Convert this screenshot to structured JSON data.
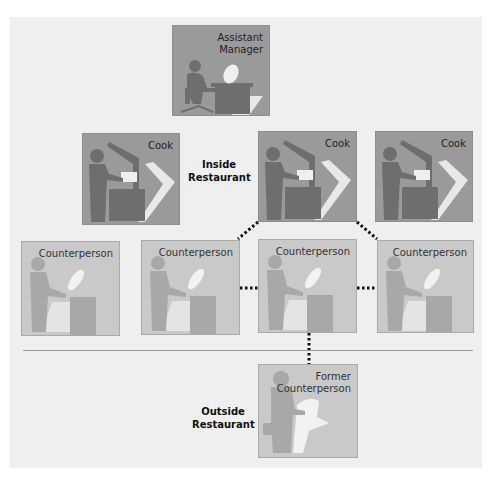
{
  "diagram": {
    "nodes": [
      {
        "id": "assistant-manager",
        "label_lines": [
          "Assistant",
          "Manager"
        ],
        "group": "inside",
        "shade": "dark",
        "icon": "person-at-desk-icon"
      },
      {
        "id": "cook-1",
        "label_lines": [
          "Cook"
        ],
        "group": "inside",
        "shade": "dark",
        "icon": "cook-at-grill-icon"
      },
      {
        "id": "cook-2",
        "label_lines": [
          "Cook"
        ],
        "group": "inside",
        "shade": "dark",
        "icon": "cook-at-grill-icon"
      },
      {
        "id": "cook-3",
        "label_lines": [
          "Cook"
        ],
        "group": "inside",
        "shade": "dark",
        "icon": "cook-at-grill-icon"
      },
      {
        "id": "counterperson-1",
        "label_lines": [
          "Counterperson"
        ],
        "group": "inside",
        "shade": "light",
        "icon": "counterperson-icon"
      },
      {
        "id": "counterperson-2",
        "label_lines": [
          "Counterperson"
        ],
        "group": "inside",
        "shade": "light",
        "icon": "counterperson-icon"
      },
      {
        "id": "counterperson-3",
        "label_lines": [
          "Counterperson"
        ],
        "group": "inside",
        "shade": "light",
        "icon": "counterperson-icon"
      },
      {
        "id": "counterperson-4",
        "label_lines": [
          "Counterperson"
        ],
        "group": "inside",
        "shade": "light",
        "icon": "counterperson-icon"
      },
      {
        "id": "former-counterperson",
        "label_lines": [
          "Former",
          "Counterperson"
        ],
        "group": "outside",
        "shade": "light",
        "icon": "person-with-bag-icon"
      }
    ],
    "edges": [
      {
        "from": "cook-2",
        "to": "counterperson-2",
        "style": "dotted"
      },
      {
        "from": "cook-2",
        "to": "counterperson-4",
        "style": "dotted"
      },
      {
        "from": "counterperson-2",
        "to": "counterperson-3",
        "style": "dotted"
      },
      {
        "from": "counterperson-3",
        "to": "counterperson-4",
        "style": "dotted"
      },
      {
        "from": "counterperson-3",
        "to": "former-counterperson",
        "style": "dotted"
      }
    ],
    "captions": {
      "inside": [
        "Inside",
        "Restaurant"
      ],
      "outside": [
        "Outside",
        "Restaurant"
      ]
    },
    "colors": {
      "background": "#efefef",
      "dark_box": "#9a9a9a",
      "light_box": "#c9c9c9",
      "silhouette_dark": "#6e6e6e",
      "silhouette_light": "#a8a8a8",
      "connector": "#111111"
    }
  }
}
